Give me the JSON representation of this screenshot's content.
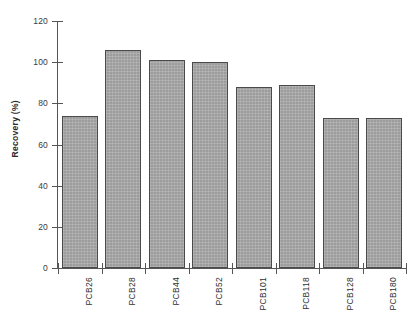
{
  "chart_data": {
    "type": "bar",
    "title": "",
    "xlabel": "",
    "ylabel": "Recovery (%)",
    "categories": [
      "PCB26",
      "PCB28",
      "PCB44",
      "PCB52",
      "PCB101",
      "PCB118",
      "PCB128",
      "PCB180"
    ],
    "values": [
      74,
      106,
      101,
      100,
      88,
      89,
      73,
      73
    ],
    "ylim": [
      0,
      120
    ],
    "yticks": [
      0,
      20,
      40,
      60,
      80,
      100,
      120
    ],
    "ytick_labels": [
      "0",
      "20",
      "40",
      "60",
      "80",
      "100",
      "120"
    ],
    "grid": false,
    "legend": false,
    "bar_color": "#9c9c9c",
    "bar_edge_color": "#4a4a4a",
    "axis_color": "#555555"
  }
}
